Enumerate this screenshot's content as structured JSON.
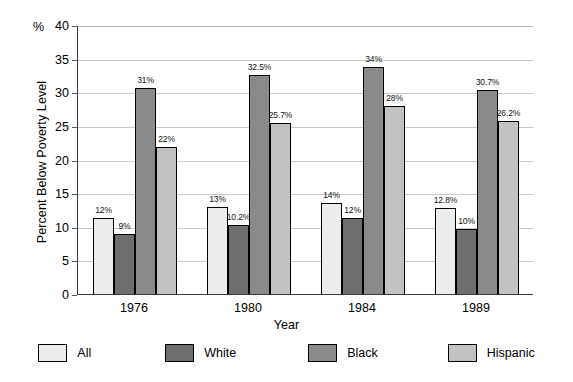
{
  "chart_data": {
    "type": "bar",
    "title": "",
    "xlabel": "Year",
    "ylabel": "Percent Below Poverty Level",
    "y_unit_prefix": "%",
    "categories": [
      "1976",
      "1980",
      "1984",
      "1989"
    ],
    "ylim": [
      0,
      40
    ],
    "yticks": [
      0,
      5,
      10,
      15,
      20,
      25,
      30,
      35,
      40
    ],
    "ytick_labels": [
      "0",
      "5",
      "10",
      "15",
      "20",
      "25",
      "30",
      "35",
      "40"
    ],
    "grid": true,
    "legend_position": "bottom",
    "series": [
      {
        "name": "All",
        "color": "#ededed",
        "values": [
          11.3,
          13.0,
          13.6,
          12.8
        ],
        "data_labels": [
          "12%",
          "13%",
          "14%",
          "12.8%"
        ]
      },
      {
        "name": "White",
        "color": "#6e6e6e",
        "values": [
          8.9,
          10.2,
          11.3,
          9.7
        ],
        "data_labels": [
          "9%",
          "10.2%",
          "12%",
          "10%"
        ]
      },
      {
        "name": "Black",
        "color": "#8a8a8a",
        "values": [
          30.7,
          32.5,
          33.7,
          30.4
        ],
        "data_labels": [
          "31%",
          "32.5%",
          "34%",
          "30.7%"
        ]
      },
      {
        "name": "Hispanic",
        "color": "#c2c2c2",
        "values": [
          21.8,
          25.4,
          27.9,
          25.8
        ],
        "data_labels": [
          "22%",
          "25.7%",
          "28%",
          "26.2%"
        ]
      }
    ]
  }
}
